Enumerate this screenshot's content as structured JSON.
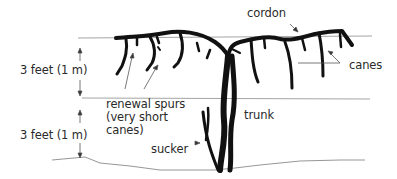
{
  "diagram": {
    "type": "grapevine cordon training diagram",
    "labels": {
      "cordon": "cordon",
      "canes": "canes",
      "dimension_upper": "3 feet (1 m)",
      "dimension_lower": "3 feet (1 m)",
      "renewal_spurs_line1": "renewal spurs",
      "renewal_spurs_line2": "(very short",
      "renewal_spurs_line3": "canes)",
      "trunk": "trunk",
      "sucker": "sucker"
    },
    "colors": {
      "vine": "#111111",
      "guide_lines": "#9a9a9a",
      "leader_lines": "#555555",
      "text": "#2a2a2a"
    }
  }
}
